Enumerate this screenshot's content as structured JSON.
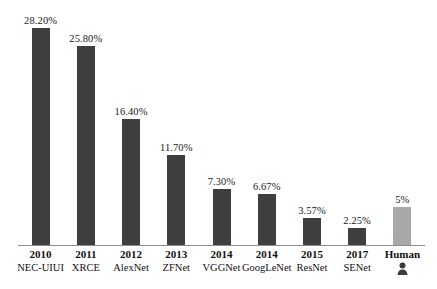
{
  "chart_data": {
    "type": "bar",
    "title": "",
    "subtitle": "",
    "xlabel": "",
    "ylabel": "",
    "grid": false,
    "legend": "none",
    "ylim": [
      0,
      30
    ],
    "categories": [
      "2010 NEC-UIUI",
      "2011 XRCE",
      "2012 AlexNet",
      "2013 ZFNet",
      "2014 VGGNet",
      "2014 GoogLeNet",
      "2015 ResNet",
      "2017 SENet",
      "Human"
    ],
    "values": [
      28.2,
      25.8,
      16.4,
      11.7,
      7.3,
      6.67,
      3.57,
      2.25,
      5
    ],
    "value_labels": [
      "28.20%",
      "25.80%",
      "16.40%",
      "11.70%",
      "7.30%",
      "6.67%",
      "3.57%",
      "2.25%",
      "5%"
    ],
    "bars": [
      {
        "year": "2010",
        "name": "NEC-UIUI",
        "value": 28.2,
        "label": "28.20%",
        "color": "#3f3f3f",
        "kind": "model"
      },
      {
        "year": "2011",
        "name": "XRCE",
        "value": 25.8,
        "label": "25.80%",
        "color": "#3f3f3f",
        "kind": "model"
      },
      {
        "year": "2012",
        "name": "AlexNet",
        "value": 16.4,
        "label": "16.40%",
        "color": "#3f3f3f",
        "kind": "model"
      },
      {
        "year": "2013",
        "name": "ZFNet",
        "value": 11.7,
        "label": "11.70%",
        "color": "#3f3f3f",
        "kind": "model"
      },
      {
        "year": "2014",
        "name": "VGGNet",
        "value": 7.3,
        "label": "7.30%",
        "color": "#3f3f3f",
        "kind": "model"
      },
      {
        "year": "2014",
        "name": "GoogLeNet",
        "value": 6.67,
        "label": "6.67%",
        "color": "#3f3f3f",
        "kind": "model"
      },
      {
        "year": "2015",
        "name": "ResNet",
        "value": 3.57,
        "label": "3.57%",
        "color": "#3f3f3f",
        "kind": "model"
      },
      {
        "year": "2017",
        "name": "SENet",
        "value": 2.25,
        "label": "2.25%",
        "color": "#3f3f3f",
        "kind": "model"
      },
      {
        "year": "Human",
        "name": "",
        "value": 5,
        "label": "5%",
        "color": "#a8a8a8",
        "kind": "human"
      }
    ],
    "colors": {
      "bar": "#3f3f3f",
      "human_bar": "#a8a8a8",
      "axis": "#8d8d8d",
      "text": "#111111",
      "background": "#ffffff"
    },
    "icons": {
      "human": "person-icon"
    }
  }
}
